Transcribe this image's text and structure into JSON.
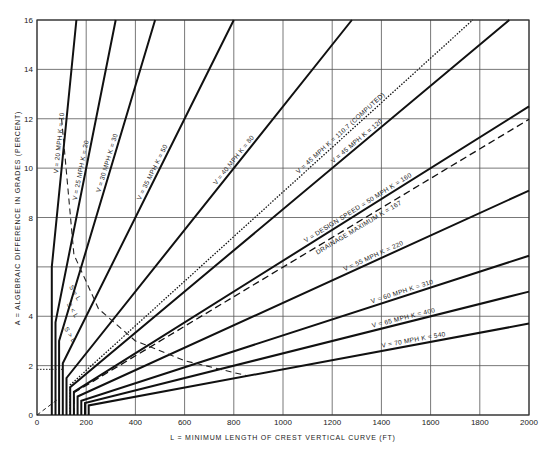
{
  "chart_data": {
    "type": "line",
    "title": "",
    "xlabel": "L = MINIMUM LENGTH OF CREST VERTICAL CURVE (FT)",
    "ylabel": "A = ALGEBRAIC DIFFERENCE IN GRADES (PERCENT)",
    "xlim": [
      0,
      2000
    ],
    "ylim": [
      0,
      16
    ],
    "xticks": [
      0,
      200,
      400,
      600,
      800,
      1000,
      1200,
      1400,
      1600,
      1800,
      2000
    ],
    "yticks": [
      0,
      2,
      4,
      6,
      8,
      10,
      12,
      14,
      16
    ],
    "ytick_labels": [
      "0",
      "2",
      "4",
      "",
      "8",
      "10",
      "12",
      "14",
      "16"
    ],
    "grid": true,
    "relation": "L = K * A",
    "series": [
      {
        "name": "V = 20 MPH  K = 10",
        "speed_mph": 20,
        "K": 10,
        "min_length": 60,
        "style": "solid"
      },
      {
        "name": "V = 25 MPH  K = 20",
        "speed_mph": 25,
        "K": 20,
        "min_length": 75,
        "style": "solid"
      },
      {
        "name": "V = 30 MPH  K = 30",
        "speed_mph": 30,
        "K": 30,
        "min_length": 90,
        "style": "solid"
      },
      {
        "name": "V = 35 MPH  K = 50",
        "speed_mph": 35,
        "K": 50,
        "min_length": 105,
        "style": "solid"
      },
      {
        "name": "V = 40 MPH  K = 80",
        "speed_mph": 40,
        "K": 80,
        "min_length": 120,
        "style": "solid"
      },
      {
        "name": "V = 45 MPH  K = 110.7 (COMPUTED)",
        "speed_mph": 45,
        "K": 110.7,
        "min_length": 135,
        "style": "dotted"
      },
      {
        "name": "V = 45 MPH  K = 120",
        "speed_mph": 45,
        "K": 120,
        "min_length": 135,
        "style": "solid"
      },
      {
        "name": "V = DESIGN SPEED = 50 MPH  K = 160",
        "speed_mph": 50,
        "K": 160,
        "min_length": 150,
        "style": "solid"
      },
      {
        "name": "DRAINAGE MAXIMUM  K = 167",
        "K": 167,
        "min_length": 150,
        "style": "dashed"
      },
      {
        "name": "V = 55 MPH  K = 220",
        "speed_mph": 55,
        "K": 220,
        "min_length": 165,
        "style": "solid"
      },
      {
        "name": "V = 60 MPH  K = 310",
        "speed_mph": 60,
        "K": 310,
        "min_length": 180,
        "style": "solid"
      },
      {
        "name": "V = 65 MPH  K = 400",
        "speed_mph": 65,
        "K": 400,
        "min_length": 195,
        "style": "solid"
      },
      {
        "name": "V = 70 MPH  K = 540",
        "speed_mph": 70,
        "K": 540,
        "min_length": 210,
        "style": "solid"
      }
    ],
    "annotations": [
      {
        "text": "S = L",
        "style": "dashed",
        "points": [
          [
            100,
            12
          ],
          [
            150,
            6.5
          ],
          [
            250,
            4.3
          ],
          [
            400,
            3.0
          ],
          [
            600,
            2.2
          ],
          [
            850,
            1.6
          ]
        ]
      },
      {
        "text": "S > L",
        "position": [
          110,
          3.5
        ]
      },
      {
        "text": "S < L",
        "position": [
          120,
          4.5
        ]
      }
    ]
  },
  "labels": {
    "xlabel": "L = MINIMUM LENGTH OF CREST VERTICAL CURVE (FT)",
    "ylabel": "A = ALGEBRAIC DIFFERENCE IN GRADES (PERCENT)"
  }
}
